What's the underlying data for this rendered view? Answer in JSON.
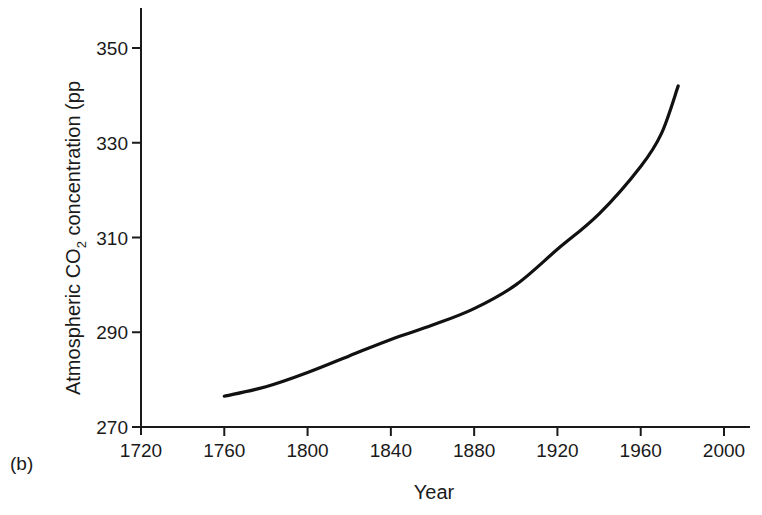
{
  "panel_label": "(b)",
  "chart_data": {
    "type": "line",
    "title": "",
    "xlabel": "Year",
    "ylabel_prefix": "Atmospheric  CO",
    "ylabel_subscript": "2",
    "ylabel_suffix": " concentration (pp",
    "xlim": [
      1720,
      2010
    ],
    "ylim": [
      270,
      358
    ],
    "xticks": [
      1720,
      1760,
      1800,
      1840,
      1880,
      1920,
      1960,
      2000
    ],
    "yticks": [
      270,
      290,
      310,
      330,
      350
    ],
    "grid": false,
    "legend": null,
    "series": [
      {
        "name": "Atmospheric CO2 concentration",
        "color": "#111111",
        "x": [
          1760,
          1780,
          1800,
          1820,
          1840,
          1860,
          1880,
          1900,
          1920,
          1940,
          1960,
          1970,
          1978
        ],
        "y": [
          276.5,
          278.5,
          281.5,
          285,
          288.5,
          291.5,
          295,
          300,
          307.5,
          315,
          325,
          332,
          342
        ]
      }
    ]
  }
}
